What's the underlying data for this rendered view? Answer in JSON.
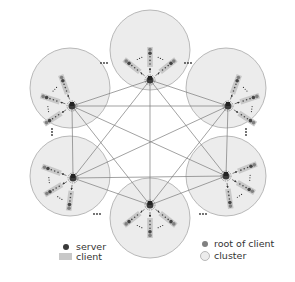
{
  "diagram": {
    "type": "network-topology",
    "colors": {
      "cluster_fill": "#ececec",
      "cluster_stroke": "#a8a8a8",
      "edge": "#7a7a7a",
      "server": "#3a3a3a",
      "client_bar": "#c8c8c8",
      "root_of_client": "#808080",
      "dots": "#333333"
    },
    "clusters": [
      {
        "id": "top",
        "cx": 150,
        "cy": 50,
        "r": 40,
        "hub": [
          150,
          80
        ]
      },
      {
        "id": "upper-right",
        "cx": 226,
        "cy": 88,
        "r": 40,
        "hub": [
          228,
          106
        ]
      },
      {
        "id": "lower-right",
        "cx": 226,
        "cy": 176,
        "r": 40,
        "hub": [
          226,
          176
        ]
      },
      {
        "id": "bottom",
        "cx": 150,
        "cy": 218,
        "r": 40,
        "hub": [
          150,
          205
        ]
      },
      {
        "id": "lower-left",
        "cx": 70,
        "cy": 176,
        "r": 40,
        "hub": [
          73,
          178
        ]
      },
      {
        "id": "upper-left",
        "cx": 70,
        "cy": 88,
        "r": 40,
        "hub": [
          72,
          106
        ]
      }
    ],
    "ellipsis": "…"
  },
  "legend": {
    "server": "server",
    "client": "client",
    "root_of_client": "root of client",
    "cluster": "cluster"
  }
}
